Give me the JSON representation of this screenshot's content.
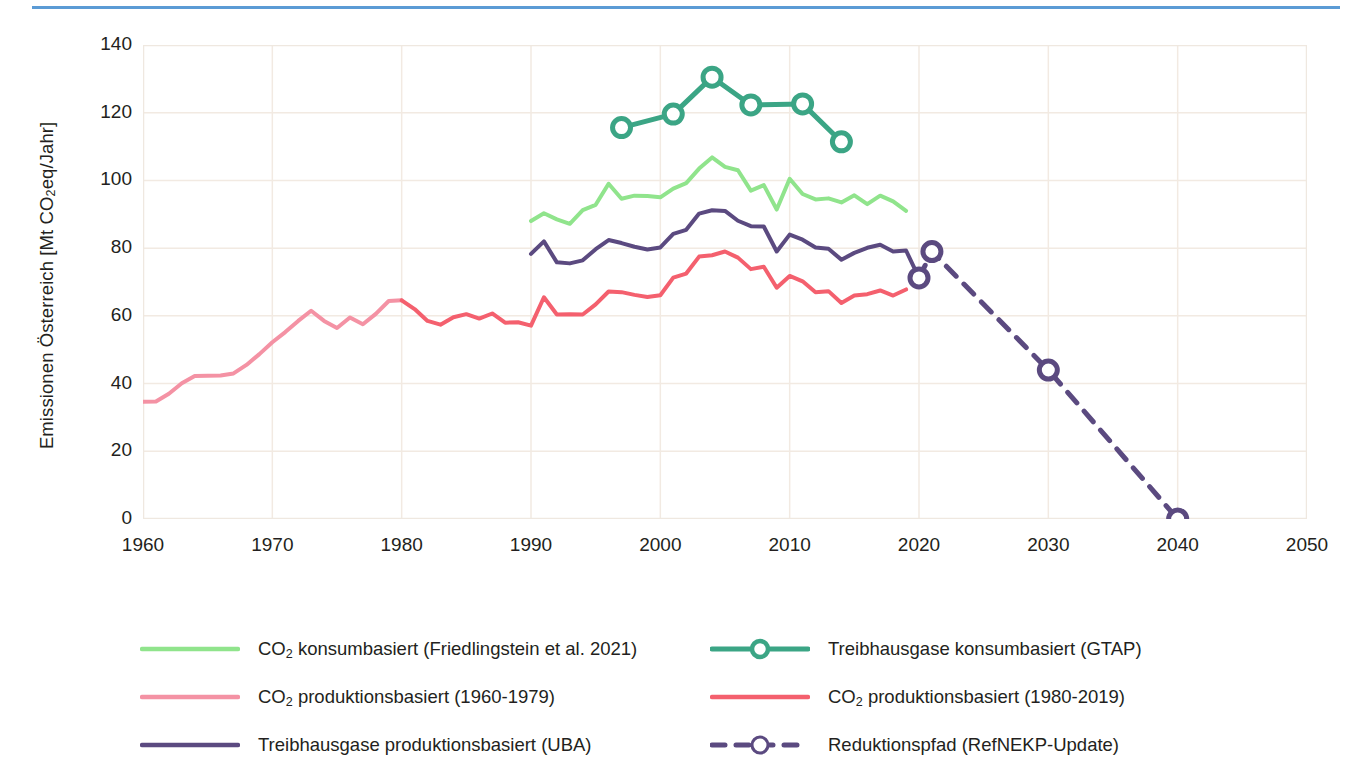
{
  "accent_rule_color": "#5B9BD5",
  "axis": {
    "ylabel_pre": "Emissionen Österreich [Mt CO",
    "ylabel_sub": "2",
    "ylabel_post": "eq/Jahr]",
    "yticks": [
      "0",
      "20",
      "40",
      "60",
      "80",
      "100",
      "120",
      "140"
    ],
    "xticks": [
      "1960",
      "1970",
      "1980",
      "1990",
      "2000",
      "2010",
      "2020",
      "2030",
      "2040",
      "2050"
    ]
  },
  "legend": {
    "rows": [
      {
        "left": {
          "icon": "line-swatch",
          "style": "solid",
          "marker": false,
          "color": "#90E48C",
          "pre": "CO",
          "sub": "2",
          "post": " konsumbasiert (Friedlingstein et al. 2021)"
        },
        "right": {
          "icon": "line-marker-swatch",
          "style": "solid",
          "marker": true,
          "color": "#3BA585",
          "pre": "",
          "sub": "",
          "post": "Treibhausgase konsumbasiert (GTAP)"
        }
      },
      {
        "left": {
          "icon": "line-swatch",
          "style": "solid",
          "marker": false,
          "color": "#F492A4",
          "pre": "CO",
          "sub": "2",
          "post": " produktionsbasiert (1960-1979)"
        },
        "right": {
          "icon": "line-swatch",
          "style": "solid",
          "marker": false,
          "color": "#F4606E",
          "pre": "CO",
          "sub": "2",
          "post": " produktionsbasiert (1980-2019)"
        }
      },
      {
        "left": {
          "icon": "line-swatch",
          "style": "solid",
          "marker": false,
          "color": "#5B4A80",
          "pre": "",
          "sub": "",
          "post": "Treibhausgase produktionsbasiert  (UBA)"
        },
        "right": {
          "icon": "dashed-line-marker-swatch",
          "style": "dashed",
          "marker": true,
          "color": "#5B4A80",
          "pre": "",
          "sub": "",
          "post": "Reduktionspfad (RefNEKP-Update)"
        }
      }
    ]
  },
  "chart_data": {
    "type": "line",
    "title": "",
    "xlabel": "",
    "ylabel": "Emissionen Österreich [Mt CO2eq/Jahr]",
    "xlim": [
      1960,
      2050
    ],
    "ylim": [
      0,
      140
    ],
    "xticks": [
      1960,
      1970,
      1980,
      1990,
      2000,
      2010,
      2020,
      2030,
      2040,
      2050
    ],
    "yticks": [
      0,
      20,
      40,
      60,
      80,
      100,
      120,
      140
    ],
    "grid": true,
    "legend_position": "bottom",
    "series": [
      {
        "name": "CO2 produktionsbasiert (1960-1979)",
        "color": "#F492A4",
        "style": "solid",
        "width": 4,
        "markers": false,
        "x": [
          1960,
          1961,
          1962,
          1963,
          1964,
          1965,
          1966,
          1967,
          1968,
          1969,
          1970,
          1971,
          1972,
          1973,
          1974,
          1975,
          1976,
          1977,
          1978,
          1979,
          1980
        ],
        "y": [
          34.6,
          34.7,
          37.0,
          40.1,
          42.2,
          42.3,
          42.4,
          43.0,
          45.5,
          48.7,
          52.2,
          55.2,
          58.5,
          61.5,
          58.5,
          56.4,
          59.5,
          57.5,
          60.6,
          64.4,
          64.6
        ]
      },
      {
        "name": "CO2 produktionsbasiert (1980-2019)",
        "color": "#F4606E",
        "style": "solid",
        "width": 4,
        "markers": false,
        "x": [
          1980,
          1981,
          1982,
          1983,
          1984,
          1985,
          1986,
          1987,
          1988,
          1989,
          1990,
          1991,
          1992,
          1993,
          1994,
          1995,
          1996,
          1997,
          1998,
          1999,
          2000,
          2001,
          2002,
          2003,
          2004,
          2005,
          2006,
          2007,
          2008,
          2009,
          2010,
          2011,
          2012,
          2013,
          2014,
          2015,
          2016,
          2017,
          2018,
          2019
        ],
        "y": [
          64.6,
          62.0,
          58.5,
          57.4,
          59.6,
          60.5,
          59.2,
          60.7,
          58.0,
          58.1,
          57.1,
          65.5,
          60.4,
          60.5,
          60.4,
          63.4,
          67.2,
          67.0,
          66.2,
          65.6,
          66.1,
          71.3,
          72.5,
          77.5,
          77.9,
          79.0,
          77.2,
          73.8,
          74.5,
          68.3,
          71.8,
          70.2,
          67.0,
          67.3,
          63.8,
          66.0,
          66.4,
          67.5,
          66.0,
          67.8
        ]
      },
      {
        "name": "CO2 konsumbasiert (Friedlingstein et al. 2021)",
        "color": "#90E48C",
        "style": "solid",
        "width": 4,
        "markers": false,
        "x": [
          1990,
          1991,
          1992,
          1993,
          1994,
          1995,
          1996,
          1997,
          1998,
          1999,
          2000,
          2001,
          2002,
          2003,
          2004,
          2005,
          2006,
          2007,
          2008,
          2009,
          2010,
          2011,
          2012,
          2013,
          2014,
          2015,
          2016,
          2017,
          2018,
          2019
        ],
        "y": [
          88.0,
          90.3,
          88.5,
          87.2,
          91.2,
          92.8,
          99.0,
          94.6,
          95.5,
          95.4,
          95.0,
          97.6,
          99.2,
          103.5,
          106.8,
          104.0,
          103.0,
          97.0,
          98.6,
          91.4,
          100.5,
          96.0,
          94.4,
          94.7,
          93.5,
          95.6,
          93.0,
          95.5,
          93.8,
          91.0
        ]
      },
      {
        "name": "Treibhausgase produktionsbasiert (UBA)",
        "color": "#5B4A80",
        "style": "solid",
        "width": 4,
        "markers": false,
        "x": [
          1990,
          1991,
          1992,
          1993,
          1994,
          1995,
          1996,
          1997,
          1998,
          1999,
          2000,
          2001,
          2002,
          2003,
          2004,
          2005,
          2006,
          2007,
          2008,
          2009,
          2010,
          2011,
          2012,
          2013,
          2014,
          2015,
          2016,
          2017,
          2018,
          2019,
          2020
        ],
        "y": [
          78.3,
          82.0,
          75.8,
          75.5,
          76.4,
          79.7,
          82.4,
          81.5,
          80.4,
          79.6,
          80.2,
          84.2,
          85.4,
          90.2,
          91.2,
          91.0,
          88.1,
          86.5,
          86.4,
          79.0,
          84.0,
          82.5,
          80.2,
          79.8,
          76.6,
          78.6,
          80.1,
          81.0,
          79.0,
          79.3,
          71.2
        ]
      },
      {
        "name": "Treibhausgase konsumbasiert (GTAP)",
        "color": "#3BA585",
        "style": "solid",
        "width": 5,
        "markers": true,
        "x": [
          1997,
          2001,
          2004,
          2007,
          2011,
          2014
        ],
        "y": [
          115.6,
          119.6,
          130.5,
          122.3,
          122.6,
          111.4
        ]
      },
      {
        "name": "Reduktionspfad (RefNEKP-Update)",
        "color": "#5B4A80",
        "style": "dashed",
        "width": 5,
        "markers": true,
        "x": [
          2020,
          2021,
          2030,
          2040
        ],
        "y": [
          71.2,
          79.0,
          44.0,
          0.0
        ]
      }
    ]
  }
}
